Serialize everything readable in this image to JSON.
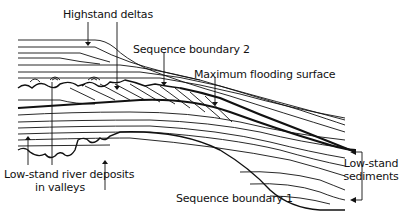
{
  "diagram": {
    "labels": {
      "highstand_deltas": "Highstand deltas",
      "sequence_boundary_2": "Sequence boundary 2",
      "maximum_flooding_surface": "Maximum flooding surface",
      "lowstand_river_line1": "Low-stand river deposits",
      "lowstand_river_line2": "in valleys",
      "sequence_boundary_1": "Sequence boundary 1",
      "lowstand_sediments_line1": "Low-stand",
      "lowstand_sediments_line2": "sediments"
    },
    "colors": {
      "ink": "#111111",
      "background": "#ffffff"
    }
  }
}
